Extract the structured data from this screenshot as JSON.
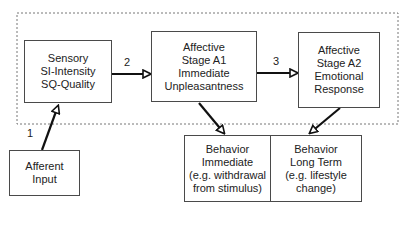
{
  "nodes": {
    "sensory": [
      "Sensory",
      "SI-Intensity",
      "SQ-Quality"
    ],
    "affective_a1": [
      "Affective",
      "Stage A1",
      "Immediate",
      "Unpleasantness"
    ],
    "affective_a2": [
      "Affective",
      "Stage A2",
      "Emotional",
      "Response"
    ],
    "afferent": [
      "Afferent",
      "Input"
    ],
    "behavior_immediate": [
      "Behavior",
      "Immediate",
      "(e.g. withdrawal",
      "from stimulus)"
    ],
    "behavior_long_term": [
      "Behavior",
      "Long Term",
      "(e.g. lifestyle",
      "change)"
    ]
  },
  "edge_labels": {
    "one": "1",
    "two": "2",
    "three": "3"
  }
}
